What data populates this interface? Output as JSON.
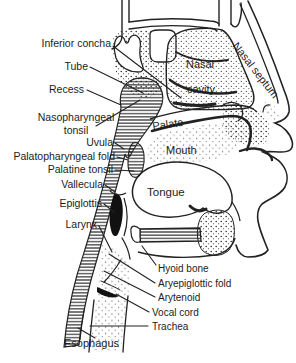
{
  "figure": {
    "labels": {
      "inferior_concha": "Inferior concha",
      "tube": "Tube",
      "recess": "Recess",
      "nasopharyngeal": "Nasopharyngeal",
      "tonsil": "tonsil",
      "uvula": "Uvula",
      "palatopharyngeal_fold": "Palatopharyngeal fold",
      "palatine_tonsil": "Palatine tonsil",
      "vallecula": "Vallecula",
      "epiglottis": "Epiglottis",
      "larynx": "Larynx",
      "esophagus": "Esophagus",
      "hyoid_bone": "Hyoid bone",
      "aryepiglottic_fold": "Aryepiglottic fold",
      "arytenoid": "Arytenoid",
      "vocal_cord": "Vocal cord",
      "trachea": "Trachea",
      "nasal_septum": "Nasal septum",
      "nasal": "Nasal",
      "cavity": "cavity",
      "palate": "Palate",
      "mouth": "Mouth",
      "tongue": "Tongue"
    },
    "colors": {
      "ink": "#222222",
      "paper": "#ffffff"
    }
  }
}
